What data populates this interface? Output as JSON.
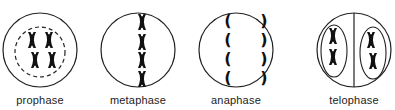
{
  "stages": [
    {
      "id": "prophase",
      "label": "prophase",
      "cx": 40
    },
    {
      "id": "metaphase",
      "label": "metaphase",
      "cx": 138
    },
    {
      "id": "anaphase",
      "label": "anaphase",
      "cx": 236
    },
    {
      "id": "telophase",
      "label": "telophase",
      "cx": 354
    }
  ],
  "colors": {
    "stroke": "#222222",
    "chromosome": "#111111"
  }
}
